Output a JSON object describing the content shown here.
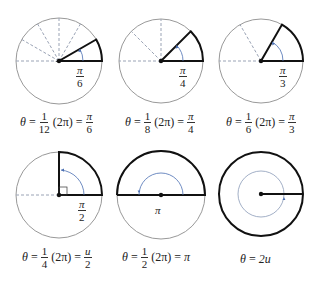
{
  "figure": {
    "colors": {
      "circle": "#999999",
      "bold": "#111111",
      "dashed": "#9aa3b5",
      "arc": "#4a6fb3"
    },
    "panels": [
      {
        "id": "pi6",
        "center": [
          59,
          61
        ],
        "radius": 43,
        "fraction_num": "1",
        "fraction_den": "12",
        "result_num": "π",
        "result_den": "6",
        "label_num": "π",
        "label_den": "6",
        "angle_deg": 30
      },
      {
        "id": "pi4",
        "center": [
          161,
          61
        ],
        "radius": 42,
        "fraction_num": "1",
        "fraction_den": "8",
        "result_num": "π",
        "result_den": "4",
        "label_num": "π",
        "label_den": "4",
        "angle_deg": 45
      },
      {
        "id": "pi3",
        "center": [
          261,
          61
        ],
        "radius": 42,
        "fraction_num": "1",
        "fraction_den": "6",
        "result_num": "π",
        "result_den": "3",
        "label_num": "π",
        "label_den": "3",
        "angle_deg": 60
      },
      {
        "id": "pi2",
        "center": [
          59,
          195
        ],
        "radius": 43,
        "fraction_num": "1",
        "fraction_den": "4",
        "result_num": "u",
        "result_den": "2",
        "label_num": "π",
        "label_den": "2",
        "angle_deg": 90
      },
      {
        "id": "pi",
        "center": [
          161,
          195
        ],
        "radius": 44,
        "fraction_num": "1",
        "fraction_den": "2",
        "result": "π",
        "label": "π",
        "angle_deg": 180
      },
      {
        "id": "2pi",
        "center": [
          261,
          194
        ],
        "radius": 42,
        "result": "2u",
        "angle_deg": 360
      }
    ],
    "captions": {
      "theta": "θ",
      "equals": "=",
      "two_pi": "(2π)"
    }
  }
}
